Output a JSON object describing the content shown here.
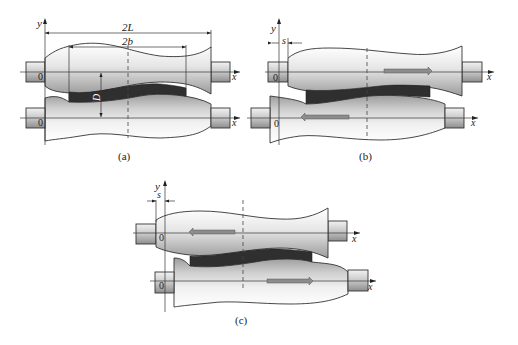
{
  "figure": {
    "panels": [
      {
        "id": "a",
        "caption": "(a)",
        "axis_y": "y",
        "axis_x_top": "x",
        "axis_x_bottom": "x",
        "origin_top": "0",
        "origin_bottom": "0",
        "dim_outer": "2L",
        "dim_inner": "2b",
        "gap_label": "D",
        "shift_label": ""
      },
      {
        "id": "b",
        "caption": "(b)",
        "axis_y": "y",
        "axis_x_top": "x",
        "axis_x_bottom": "x",
        "origin_top": "0",
        "origin_bottom": "0",
        "shift_label": "s",
        "top_roll_arrow": "right",
        "bottom_roll_arrow": "left"
      },
      {
        "id": "c",
        "caption": "(c)",
        "axis_y": "y",
        "axis_x_top": "x",
        "axis_x_bottom": "x",
        "origin_top": "0",
        "origin_bottom": "0",
        "shift_label": "s",
        "top_roll_arrow": "left",
        "bottom_roll_arrow": "right"
      }
    ]
  },
  "colors": {
    "outline": "#333333",
    "strip": "#2f2f2f",
    "roll_light": "#f4f4f4",
    "roll_dark": "#9a9a9a",
    "arrow_fill": "#8c8c8c"
  }
}
